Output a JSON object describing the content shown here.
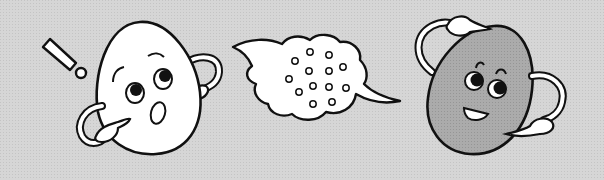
{
  "scene": {
    "description": "Two egg-shaped cartoon characters with a dotted speech bubble between them",
    "colors": {
      "background": "#d3d3d3",
      "outline": "#111111",
      "left_egg_fill": "#ffffff",
      "right_egg_fill": "#a9a9a9",
      "bubble_fill": "#ffffff"
    },
    "left_character": {
      "expression": "surprised",
      "has_exclamation_mark": true
    },
    "speech_bubble": {
      "dot_count": 15
    },
    "right_character": {
      "expression": "smiling"
    }
  }
}
